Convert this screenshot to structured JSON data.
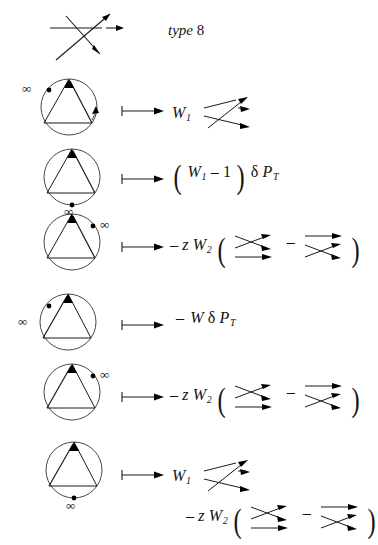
{
  "header": {
    "label_italic": "type",
    "label_number": "8",
    "tangle": "crossing-3strand-type8"
  },
  "symbols": {
    "mapsto": "maps-to-arrow",
    "infinity": "∞",
    "minus": "–",
    "delta": "δ",
    "paren_open": "(",
    "paren_close": ")"
  },
  "rows": [
    {
      "id": "row-1",
      "diagram": {
        "name": "circle-triangle-diagram",
        "infinity_marker": "left-outside",
        "dot_position": "upper-left",
        "arrow_edges": [
          "right-edge-up",
          "circle-arc-right"
        ]
      },
      "formula": {
        "terms": [
          {
            "type": "var",
            "text": "W",
            "sub": "1"
          },
          {
            "type": "tangle",
            "text": "tangle-3strand-a"
          }
        ],
        "plain": "W_1  tangle"
      }
    },
    {
      "id": "row-2",
      "diagram": {
        "name": "circle-triangle-diagram",
        "infinity_marker": "bottom-outside",
        "dot_position": "bottom",
        "arrow_edges": [
          "right-edge-up"
        ]
      },
      "formula": {
        "terms": [
          {
            "type": "paren",
            "text": "("
          },
          {
            "type": "var",
            "text": "W",
            "sub": "1"
          },
          {
            "type": "op",
            "text": "–"
          },
          {
            "type": "num",
            "text": "1"
          },
          {
            "type": "paren",
            "text": ")"
          },
          {
            "type": "op",
            "text": "δ"
          },
          {
            "type": "var",
            "text": "P",
            "sub": "T"
          }
        ],
        "plain": "( W_1 - 1 ) delta P_T"
      }
    },
    {
      "id": "row-3",
      "diagram": {
        "name": "circle-triangle-diagram",
        "infinity_marker": "upper-right-outside",
        "dot_position": "upper-right",
        "arrow_edges": [
          "right-edge-up"
        ]
      },
      "formula": {
        "terms": [
          {
            "type": "op",
            "text": "–"
          },
          {
            "type": "var",
            "text": "z"
          },
          {
            "type": "var",
            "text": "W",
            "sub": "2"
          },
          {
            "type": "paren",
            "text": "("
          },
          {
            "type": "tangle",
            "text": "tangle-2strand-b"
          },
          {
            "type": "op",
            "text": "–"
          },
          {
            "type": "tangle",
            "text": "tangle-2strand-c"
          },
          {
            "type": "paren",
            "text": ")"
          }
        ],
        "plain": "- z W_2 ( tangle - tangle )"
      }
    },
    {
      "id": "row-4",
      "diagram": {
        "name": "circle-triangle-diagram",
        "infinity_marker": "left-outside",
        "dot_position": "upper-left",
        "arrow_edges": [
          "left-edge-up"
        ]
      },
      "formula": {
        "terms": [
          {
            "type": "op",
            "text": "–"
          },
          {
            "type": "var",
            "text": "W"
          },
          {
            "type": "op",
            "text": "δ"
          },
          {
            "type": "var",
            "text": "P",
            "sub": "T"
          }
        ],
        "plain": "- W delta P_T"
      }
    },
    {
      "id": "row-5",
      "diagram": {
        "name": "circle-triangle-diagram",
        "infinity_marker": "upper-right-outside",
        "dot_position": "upper-right",
        "arrow_edges": [
          "left-edge-up"
        ]
      },
      "formula": {
        "terms": [
          {
            "type": "op",
            "text": "–"
          },
          {
            "type": "var",
            "text": "z"
          },
          {
            "type": "var",
            "text": "W",
            "sub": "2"
          },
          {
            "type": "paren",
            "text": "("
          },
          {
            "type": "tangle",
            "text": "tangle-2strand-d"
          },
          {
            "type": "op",
            "text": "–"
          },
          {
            "type": "tangle",
            "text": "tangle-2strand-e"
          },
          {
            "type": "paren",
            "text": ")"
          }
        ],
        "plain": "- z W_2 ( tangle - tangle )"
      }
    },
    {
      "id": "row-6",
      "diagram": {
        "name": "circle-triangle-diagram",
        "infinity_marker": "bottom-outside",
        "dot_position": "bottom",
        "arrow_edges": [
          "left-edge-up"
        ]
      },
      "formula_line1": {
        "terms": [
          {
            "type": "var",
            "text": "W",
            "sub": "1"
          },
          {
            "type": "tangle",
            "text": "tangle-3strand-a"
          }
        ],
        "plain": "W_1  tangle"
      },
      "formula_line2": {
        "terms": [
          {
            "type": "op",
            "text": "–"
          },
          {
            "type": "var",
            "text": "z"
          },
          {
            "type": "var",
            "text": "W",
            "sub": "2"
          },
          {
            "type": "paren",
            "text": "("
          },
          {
            "type": "tangle",
            "text": "tangle-2strand-b"
          },
          {
            "type": "op",
            "text": "–"
          },
          {
            "type": "tangle",
            "text": "tangle-2strand-c"
          },
          {
            "type": "paren",
            "text": ")"
          }
        ],
        "plain": "- z W_2 ( tangle - tangle )"
      }
    }
  ]
}
